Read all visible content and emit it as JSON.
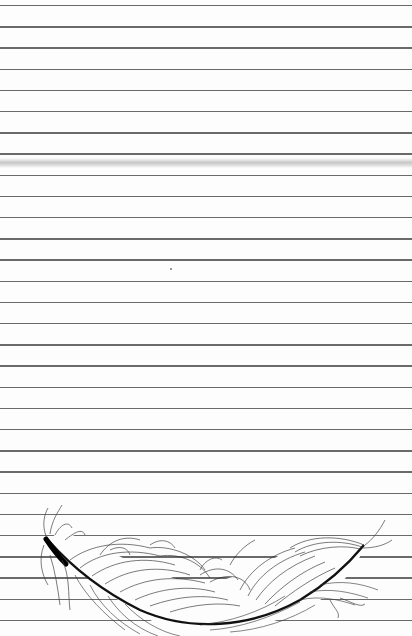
{
  "paper": {
    "type": "lined-notepaper",
    "background_color": "#fdfdfd",
    "rule_color": "#6a6a6a",
    "rule_count": 30,
    "rule_first_y": 5,
    "rule_spacing": 21.2
  },
  "decorations": {
    "crease": {
      "description": "gray fold smear",
      "y": 158
    },
    "illustration": {
      "icon": "feather-icon",
      "description": "ink line drawing of a feather across bottom of page"
    }
  }
}
